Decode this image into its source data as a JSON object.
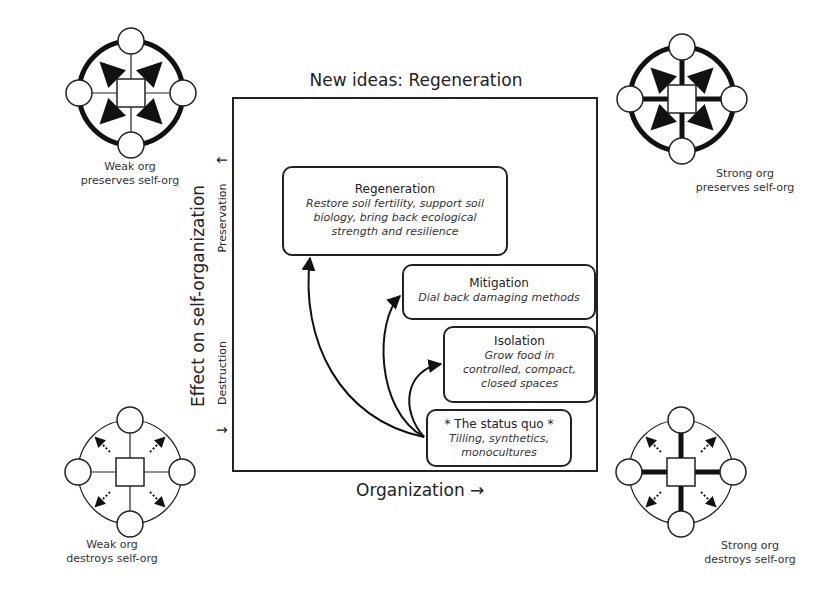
{
  "title": "New ideas: Regeneration",
  "axes": {
    "y_label": "Effect on self-organization",
    "y_upper": "Preservation",
    "y_lower": "Destruction",
    "x_label": "Organization"
  },
  "nodes": [
    {
      "id": "regeneration",
      "heading": "Regeneration",
      "lines": [
        "Restore soil fertility, support soil",
        "biology, bring back ecological",
        "strength and resilience"
      ]
    },
    {
      "id": "mitigation",
      "heading": "Mitigation",
      "lines": [
        "Dial back damaging methods"
      ]
    },
    {
      "id": "isolation",
      "heading": "Isolation",
      "lines": [
        "Grow food in",
        "controlled, compact,",
        "closed spaces"
      ]
    },
    {
      "id": "status_quo",
      "heading": "* The status quo *",
      "lines": [
        "Tilling, synthetics,",
        "monocultures"
      ]
    }
  ],
  "corners": {
    "top_left": [
      "Weak org",
      "preserves self-org"
    ],
    "top_right": [
      "Strong org",
      "preserves self-org"
    ],
    "bottom_left": [
      "Weak org",
      "destroys self-org"
    ],
    "bottom_right": [
      "Strong org",
      "destroys self-org"
    ]
  },
  "icons": {
    "arrow_up": "↑",
    "arrow_down": "↓",
    "arrow_right": "→"
  }
}
